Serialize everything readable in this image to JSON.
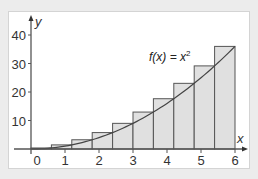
{
  "chart_data": {
    "type": "bar",
    "title": "",
    "xlabel": "x",
    "ylabel": "y",
    "annotation": "f(x) = x²",
    "function": "x^2",
    "xlim": [
      0,
      6
    ],
    "ylim": [
      0,
      40
    ],
    "x_ticks": [
      "0",
      "1",
      "2",
      "3",
      "4",
      "5",
      "6"
    ],
    "y_ticks": [
      "10",
      "20",
      "30",
      "40"
    ],
    "grid": false,
    "legend": null,
    "bars": {
      "description": "Right-endpoint rectangles of width 0.6 under f(x) = x^2",
      "left_edges": [
        0,
        0.6,
        1.2,
        1.8,
        2.4,
        3.0,
        3.6,
        4.2,
        4.8,
        5.4
      ],
      "right_edges": [
        0.6,
        1.2,
        1.8,
        2.4,
        3.0,
        3.6,
        4.2,
        4.8,
        5.4,
        6.0
      ],
      "heights": [
        0.36,
        1.44,
        3.24,
        5.76,
        9.0,
        12.96,
        17.64,
        23.04,
        29.16,
        36.0
      ]
    },
    "colors": {
      "bar_fill": "#e0e0e0",
      "bar_stroke": "#555555",
      "curve": "#444444",
      "axis": "#555555",
      "panel_bg": "#ffffff",
      "page_bg": "#ececec"
    }
  },
  "labels": {
    "x_axis": "x",
    "y_axis": "y",
    "function_prefix": "f(x) = x",
    "function_exp": "2",
    "x_ticks": [
      "0",
      "1",
      "2",
      "3",
      "4",
      "5",
      "6"
    ],
    "y_ticks": [
      "10",
      "20",
      "30",
      "40"
    ]
  }
}
